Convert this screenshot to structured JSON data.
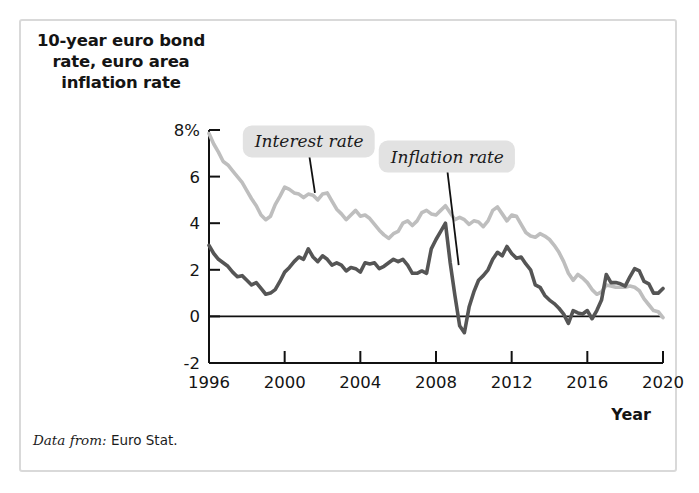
{
  "figure": {
    "title": "10-year euro bond\nrate, euro area\ninflation rate",
    "title_line1": "10-year euro bond",
    "title_line2": "rate, euro area",
    "title_line3": "inflation rate",
    "source_lead": "Data from:",
    "source_body": "Euro Stat.",
    "border_color": "#d9d9d9",
    "background_color": "#ffffff"
  },
  "chart_data": {
    "type": "line",
    "title": "10-year euro bond rate, euro area inflation rate",
    "xlabel": "Year",
    "ylabel": "",
    "xlim": [
      1996,
      2020
    ],
    "ylim": [
      -2,
      8
    ],
    "xticks": [
      1996,
      2000,
      2004,
      2008,
      2012,
      2016,
      2020
    ],
    "xticklabels": [
      "1996",
      "2000",
      "2004",
      "2008",
      "2012",
      "2016",
      "2020"
    ],
    "yticks": [
      -2,
      0,
      2,
      4,
      6,
      8
    ],
    "yticklabels": [
      "-2",
      "0",
      "2",
      "4",
      "6",
      "8%"
    ],
    "grid": false,
    "legend_position": "inline-annotations",
    "zero_line": 0,
    "annotations": [
      {
        "text": "Interest rate",
        "series": "Interest rate",
        "label_x": 2001.3,
        "label_y": 7.25,
        "leader_to_x": 2001.6,
        "leader_to_y": 5.3,
        "background": "#e2e2e2"
      },
      {
        "text": "Inflation rate",
        "series": "Inflation rate",
        "label_x": 2008.6,
        "label_y": 6.6,
        "leader_to_x": 2009.2,
        "leader_to_y": 2.2,
        "background": "#e2e2e2"
      }
    ],
    "series": [
      {
        "name": "Interest rate",
        "color": "#bebebe",
        "linewidth": 3.6,
        "x": [
          1996.0,
          1996.25,
          1996.5,
          1996.75,
          1997.0,
          1997.25,
          1997.5,
          1997.75,
          1998.0,
          1998.25,
          1998.5,
          1998.75,
          1999.0,
          1999.25,
          1999.5,
          1999.75,
          2000.0,
          2000.25,
          2000.5,
          2000.75,
          2001.0,
          2001.25,
          2001.5,
          2001.75,
          2002.0,
          2002.25,
          2002.5,
          2002.75,
          2003.0,
          2003.25,
          2003.5,
          2003.75,
          2004.0,
          2004.25,
          2004.5,
          2004.75,
          2005.0,
          2005.25,
          2005.5,
          2005.75,
          2006.0,
          2006.25,
          2006.5,
          2006.75,
          2007.0,
          2007.25,
          2007.5,
          2007.75,
          2008.0,
          2008.25,
          2008.5,
          2008.75,
          2009.0,
          2009.25,
          2009.5,
          2009.75,
          2010.0,
          2010.25,
          2010.5,
          2010.75,
          2011.0,
          2011.25,
          2011.5,
          2011.75,
          2012.0,
          2012.25,
          2012.5,
          2012.75,
          2013.0,
          2013.25,
          2013.5,
          2013.75,
          2014.0,
          2014.25,
          2014.5,
          2014.75,
          2015.0,
          2015.25,
          2015.5,
          2015.75,
          2016.0,
          2016.25,
          2016.5,
          2016.75,
          2017.0,
          2017.25,
          2017.5,
          2017.75,
          2018.0,
          2018.25,
          2018.5,
          2018.75,
          2019.0,
          2019.25,
          2019.5,
          2019.75,
          2020.0
        ],
        "y": [
          7.85,
          7.4,
          7.05,
          6.65,
          6.5,
          6.25,
          6.0,
          5.75,
          5.4,
          5.05,
          4.75,
          4.35,
          4.15,
          4.3,
          4.8,
          5.15,
          5.55,
          5.45,
          5.3,
          5.25,
          5.1,
          5.25,
          5.2,
          5.0,
          5.25,
          5.3,
          4.95,
          4.6,
          4.4,
          4.15,
          4.35,
          4.55,
          4.3,
          4.35,
          4.2,
          3.95,
          3.7,
          3.5,
          3.35,
          3.55,
          3.65,
          4.0,
          4.1,
          3.9,
          4.1,
          4.45,
          4.55,
          4.4,
          4.35,
          4.55,
          4.75,
          4.45,
          4.15,
          4.25,
          4.15,
          3.95,
          4.1,
          4.05,
          3.85,
          4.1,
          4.55,
          4.7,
          4.4,
          4.1,
          4.35,
          4.3,
          3.95,
          3.6,
          3.45,
          3.4,
          3.55,
          3.45,
          3.3,
          3.05,
          2.75,
          2.35,
          1.85,
          1.55,
          1.8,
          1.65,
          1.45,
          1.15,
          0.95,
          1.05,
          1.35,
          1.3,
          1.25,
          1.25,
          1.25,
          1.3,
          1.25,
          1.1,
          0.75,
          0.5,
          0.25,
          0.2,
          -0.05
        ]
      },
      {
        "name": "Inflation rate",
        "color": "#555555",
        "linewidth": 3.6,
        "x": [
          1996.0,
          1996.25,
          1996.5,
          1996.75,
          1997.0,
          1997.25,
          1997.5,
          1997.75,
          1998.0,
          1998.25,
          1998.5,
          1998.75,
          1999.0,
          1999.25,
          1999.5,
          1999.75,
          2000.0,
          2000.25,
          2000.5,
          2000.75,
          2001.0,
          2001.25,
          2001.5,
          2001.75,
          2002.0,
          2002.25,
          2002.5,
          2002.75,
          2003.0,
          2003.25,
          2003.5,
          2003.75,
          2004.0,
          2004.25,
          2004.5,
          2004.75,
          2005.0,
          2005.25,
          2005.5,
          2005.75,
          2006.0,
          2006.25,
          2006.5,
          2006.75,
          2007.0,
          2007.25,
          2007.5,
          2007.75,
          2008.0,
          2008.25,
          2008.5,
          2008.75,
          2009.0,
          2009.25,
          2009.5,
          2009.75,
          2010.0,
          2010.25,
          2010.5,
          2010.75,
          2011.0,
          2011.25,
          2011.5,
          2011.75,
          2012.0,
          2012.25,
          2012.5,
          2012.75,
          2013.0,
          2013.25,
          2013.5,
          2013.75,
          2014.0,
          2014.25,
          2014.5,
          2014.75,
          2015.0,
          2015.25,
          2015.5,
          2015.75,
          2016.0,
          2016.25,
          2016.5,
          2016.75,
          2017.0,
          2017.25,
          2017.5,
          2017.75,
          2018.0,
          2018.25,
          2018.5,
          2018.75,
          2019.0,
          2019.25,
          2019.5,
          2019.75,
          2020.0
        ],
        "y": [
          3.05,
          2.7,
          2.45,
          2.3,
          2.15,
          1.9,
          1.7,
          1.75,
          1.55,
          1.35,
          1.45,
          1.2,
          0.95,
          1.0,
          1.15,
          1.5,
          1.9,
          2.1,
          2.35,
          2.55,
          2.45,
          2.9,
          2.55,
          2.35,
          2.6,
          2.45,
          2.2,
          2.3,
          2.2,
          1.95,
          2.1,
          2.05,
          1.9,
          2.3,
          2.25,
          2.3,
          2.05,
          2.15,
          2.3,
          2.45,
          2.35,
          2.45,
          2.2,
          1.85,
          1.85,
          1.95,
          1.85,
          2.9,
          3.3,
          3.65,
          4.0,
          2.3,
          0.9,
          -0.4,
          -0.7,
          0.4,
          1.05,
          1.55,
          1.75,
          2.0,
          2.45,
          2.75,
          2.6,
          3.0,
          2.7,
          2.5,
          2.55,
          2.25,
          2.0,
          1.35,
          1.25,
          0.9,
          0.7,
          0.55,
          0.35,
          0.1,
          -0.3,
          0.25,
          0.15,
          0.1,
          0.25,
          -0.1,
          0.25,
          0.7,
          1.8,
          1.45,
          1.45,
          1.4,
          1.3,
          1.7,
          2.05,
          1.95,
          1.5,
          1.4,
          1.0,
          1.0,
          1.2
        ]
      }
    ]
  }
}
